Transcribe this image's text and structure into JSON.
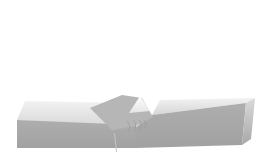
{
  "figure": {
    "kind": "friction-stir-welding-schematic",
    "canvas": {
      "width": 268,
      "height": 157,
      "background": "#ffffff"
    },
    "colors": {
      "top_face_back": "#f2f2f2",
      "top_face_front": "#d6d6d6",
      "front_face_top": "#aeaeae",
      "front_face_bottom": "#a1a1a1",
      "side_face_top": "#dadada",
      "side_face_bottom": "#a8a8a8",
      "groove_fill": "#b6b6b6",
      "peak_top": "#ffffff",
      "peak_bottom": "#e4e4e4",
      "tool_edge": "#6a6a6a",
      "tool_mid": "#a6a6a6",
      "tool_right": "#8d8d8d",
      "tool_stroke": "#585858",
      "tip_fill": "#969696",
      "tip_stroke": "#141414",
      "halo": "#ffffff",
      "flow_arc": "#9a9a9a",
      "seam": "#c6c6c6",
      "inset_left": "#cecece",
      "inset_right": "#c2c2c2",
      "particle_stroke": "#1c1c1c"
    },
    "workpiece": {
      "left_plate": {
        "top_face": "17,120 25,101 126,103 110,128",
        "front_face": "17,120 136,125 136,148 17,148"
      },
      "right_plate": {
        "top_face": "152,115 160,100 255,98 246,103",
        "front_face": "136,127 152,115 246,103 242,145 136,148",
        "side_face": "246,103 255,98 251,139 242,145"
      }
    },
    "groove": {
      "main_wall": "90,108 122,95 142,98 153,117 136,126 112,130",
      "peak_highlight": "129,113 140,96 150,111",
      "seam_line": {
        "x1": 114.5,
        "y1": 133,
        "x2": 116.5,
        "y2": 152
      }
    },
    "tool": {
      "body": "131,71 137,69 118,126 112,128",
      "tip": {
        "cx": 115,
        "cy": 127.5,
        "rx": 5.8,
        "ry": 3.3,
        "rotate": -8
      },
      "halo_main": {
        "cx": 113,
        "cy": 128.5,
        "rx": 13,
        "ry": 6.5,
        "rotate": -16,
        "opacity": 0.88
      },
      "halo_tail": {
        "cx": 105,
        "cy": 133,
        "rx": 8,
        "ry": 4,
        "rotate": -28,
        "opacity": 0.65
      }
    },
    "flow_arcs": [
      "M127,121 q5,5 1,11",
      "M133,120 q5,5 1,11",
      "M139,120 q4,5 1,10",
      "M144,120 q4,4 0,9"
    ],
    "inset": {
      "rect": {
        "x": 170,
        "y": 27,
        "width": 86,
        "height": 55
      },
      "particles": [
        [
          206,
          6,
          4.8
        ],
        [
          211.5,
          13,
          5.2
        ],
        [
          208,
          21,
          5.0
        ],
        [
          213,
          28,
          5.3
        ],
        [
          207.5,
          35,
          5.0
        ],
        [
          213,
          41,
          5.0
        ],
        [
          206.5,
          47,
          5.0
        ],
        [
          211,
          53,
          5.0
        ],
        [
          206,
          59.5,
          5.0
        ],
        [
          212,
          65,
          4.8
        ],
        [
          207,
          71,
          4.6
        ],
        [
          212.5,
          76.5,
          4.6
        ],
        [
          208.5,
          82,
          4.6
        ],
        [
          211,
          88,
          4.6
        ],
        [
          205.5,
          94,
          4.8
        ]
      ],
      "particle_stroke_width": 1.3
    }
  }
}
